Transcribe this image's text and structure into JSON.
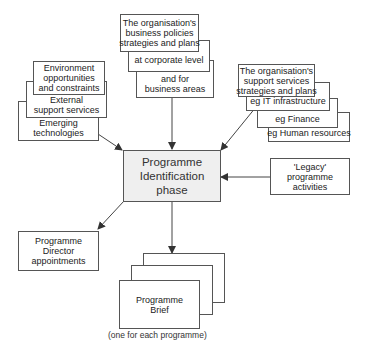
{
  "diagram": {
    "central": {
      "lines": [
        "Programme",
        "Identification",
        "phase"
      ]
    },
    "business_stack": {
      "box1": [
        "The organisation's",
        "business policies",
        "strategies and plans"
      ],
      "box2": [
        "at corporate level"
      ],
      "box3": [
        "and for",
        "business areas"
      ]
    },
    "environment_stack": {
      "box1": [
        "Environment",
        "opportunities",
        "and constraints"
      ],
      "box2": [
        "External",
        "support services"
      ],
      "box3": [
        "Emerging",
        "technologies"
      ]
    },
    "support_stack": {
      "box1": [
        "The organisation's",
        "support services",
        "strategies and plans"
      ],
      "box2": [
        "eg IT infrastructure"
      ],
      "box3": [
        "eg Finance"
      ],
      "box4": [
        "eg Human resources"
      ]
    },
    "legacy": {
      "lines": [
        "'Legacy'",
        "programme",
        "activities"
      ]
    },
    "director": {
      "lines": [
        "Programme",
        "Director",
        "appointments"
      ]
    },
    "brief": {
      "lines": [
        "Programme",
        "Brief"
      ],
      "caption": "(one for each programme)"
    },
    "colors": {
      "line": "#444444",
      "central_fill": "#efefef",
      "box_border": "#555555"
    }
  }
}
